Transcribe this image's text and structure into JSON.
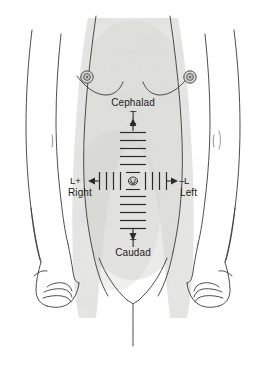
{
  "figure": {
    "kind": "anatomical-orientation-diagram",
    "width": 266,
    "height": 365,
    "background_color": "#ffffff",
    "skin_fill": "#e8e8e6",
    "outline_color": "#3a3a3a",
    "axis_color": "#2a2a2a"
  },
  "axes": {
    "origin_label": "umbilicus",
    "vertical": {
      "top_label": "Cephalad",
      "top_terminal_glyph": "T",
      "top_polarity": "+",
      "top_arrow": "up-arrow",
      "bottom_label": "Caudad",
      "bottom_terminal_glyph": "T",
      "bottom_arrow": "down-arrow",
      "ticks_above_origin": 5,
      "ticks_below_origin": 5
    },
    "horizontal": {
      "left_label": "Right",
      "left_polarity": "L+",
      "left_arrow": "left-arrow",
      "right_label": "Left",
      "right_polarity": "L",
      "right_polarity_sign": "–",
      "right_arrow": "right-arrow",
      "ticks_left_of_origin": 4,
      "ticks_right_of_origin": 4
    }
  },
  "anatomy": {
    "nipple_left_label": "nipple",
    "nipple_right_label": "nipple",
    "umbilicus_label": "umbilicus",
    "pubic_label": "pubic-region"
  }
}
